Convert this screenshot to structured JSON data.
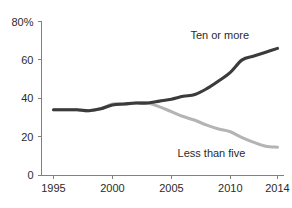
{
  "chart_data": {
    "type": "line",
    "title": "",
    "subtitle": "",
    "xlabel": "",
    "ylabel": "",
    "xlim": [
      1995,
      2014
    ],
    "ylim": [
      0,
      80
    ],
    "grid": false,
    "legend_position": "inline-annotations",
    "x_tick_labels": [
      "1995",
      "2000",
      "2005",
      "2010",
      "2014"
    ],
    "x_ticks": [
      1995,
      2000,
      2005,
      2010,
      2014
    ],
    "y_tick_labels": [
      "0",
      "20",
      "40",
      "60",
      "80%"
    ],
    "y_ticks": [
      0,
      20,
      40,
      60,
      80
    ],
    "x": [
      1995,
      1996,
      1997,
      1998,
      1999,
      2000,
      2001,
      2002,
      2003,
      2004,
      2005,
      2006,
      2007,
      2008,
      2009,
      2010,
      2011,
      2012,
      2013,
      2014
    ],
    "series": [
      {
        "name": "Ten or more",
        "color": "#3b3b3b",
        "label_x": 2009.1,
        "label_y": 71,
        "values": [
          34,
          34,
          34,
          33.5,
          34.5,
          36.5,
          37,
          37.5,
          37.5,
          38.5,
          39.5,
          41,
          42,
          45,
          49,
          53.5,
          60,
          62,
          64,
          66
        ]
      },
      {
        "name": "Less than five",
        "color": "#b4b4b4",
        "label_x": 2008.4,
        "label_y": 9.5,
        "values": [
          34,
          34,
          34,
          33.5,
          34.5,
          37,
          37,
          37.5,
          37.5,
          35.5,
          33,
          30.5,
          28.5,
          26,
          24,
          22.5,
          19.5,
          17,
          15,
          14.5
        ]
      }
    ]
  },
  "axis": {
    "y_suffix": "%"
  }
}
